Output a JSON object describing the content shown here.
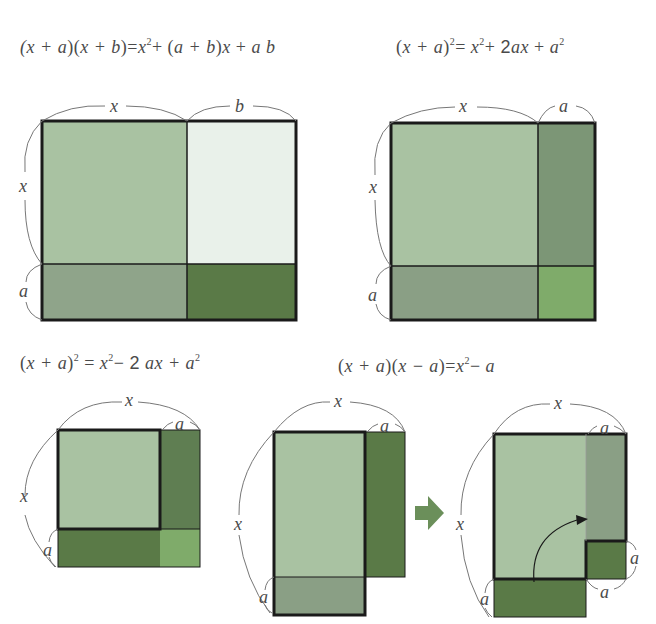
{
  "formulas": {
    "f1": {
      "lhs": "(x + a)(x + b)",
      "rhs": "x² + (a + b)x + ab"
    },
    "f2": {
      "lhs": "(x + a)²",
      "rhs": "x² + 2ax + a²"
    },
    "f3": {
      "lhs": "(x + a)²",
      "rhs": "x² − 2ax + a²"
    },
    "f4": {
      "lhs": "(x + a)(x − a)",
      "rhs": "x² − a"
    }
  },
  "labels": {
    "x": "x",
    "a": "a",
    "b": "b"
  },
  "colors": {
    "light_green": "#a9c2a2",
    "pale_green": "#e9f1ea",
    "mid_gray_green": "#8fa48a",
    "dark_green": "#5a7a47",
    "medium_green": "#6f8d68",
    "bright_green": "#7fab6a",
    "border": "#1a1a1a",
    "arrow": "#6b8f5a"
  },
  "diagrams": [
    {
      "id": "product-x-plus-a-x-plus-b",
      "top_labels": [
        "x",
        "b"
      ],
      "side_labels": [
        "x",
        "a"
      ]
    },
    {
      "id": "square-x-plus-a",
      "top_labels": [
        "x",
        "a"
      ],
      "side_labels": [
        "x",
        "a"
      ]
    },
    {
      "id": "square-x-minus-a",
      "top_labels": [
        "x",
        "a"
      ],
      "side_labels": [
        "x",
        "a"
      ]
    },
    {
      "id": "difference-of-squares-before",
      "top_labels": [
        "x",
        "a"
      ],
      "side_labels": [
        "x",
        "a"
      ]
    },
    {
      "id": "difference-of-squares-after",
      "top_labels": [
        "x",
        "a"
      ],
      "side_labels": [
        "x",
        "a",
        "a",
        "a"
      ]
    }
  ]
}
